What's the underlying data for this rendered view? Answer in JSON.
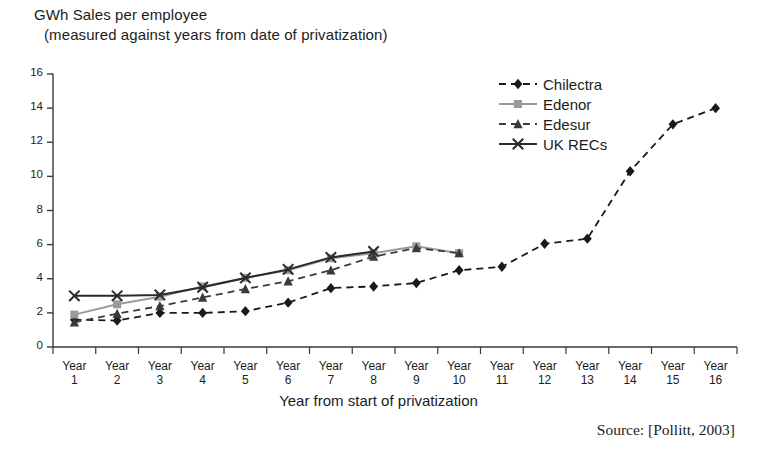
{
  "figure": {
    "title_line1": "GWh Sales per employee",
    "title_line2": "(measured against years from date of privatization)",
    "source": "Source: [Pollitt, 2003]"
  },
  "chart_data": {
    "type": "line",
    "title": "GWh Sales per employee (measured against years from date of privatization)",
    "xlabel": "Year from start of privatization",
    "ylabel": "GWh Sales per employee",
    "xlim": [
      0,
      17
    ],
    "ylim": [
      0,
      16
    ],
    "yticks": [
      0,
      2,
      4,
      6,
      8,
      10,
      12,
      14,
      16
    ],
    "grid": false,
    "legend_position": "top-right",
    "categories": [
      "Year 1",
      "Year 2",
      "Year 3",
      "Year 4",
      "Year 5",
      "Year 6",
      "Year 7",
      "Year 8",
      "Year 9",
      "Year 10",
      "Year 11",
      "Year 12",
      "Year 13",
      "Year 14",
      "Year 15",
      "Year 16"
    ],
    "x": [
      1,
      2,
      3,
      4,
      5,
      6,
      7,
      8,
      9,
      10,
      11,
      12,
      13,
      14,
      15,
      16
    ],
    "series": [
      {
        "name": "Chilectra",
        "color": "#1a1a1a",
        "marker": "diamond",
        "linestyle": "dashed",
        "values": [
          1.6,
          1.55,
          2.0,
          2.0,
          2.1,
          2.6,
          3.45,
          3.55,
          3.75,
          4.5,
          4.7,
          6.05,
          6.35,
          10.3,
          13.05,
          14.0
        ]
      },
      {
        "name": "Edenor",
        "color": "#9a9a9a",
        "marker": "square",
        "linestyle": "solid",
        "values": [
          1.9,
          2.5,
          2.95,
          3.55,
          4.05,
          4.5,
          5.2,
          5.5,
          5.9,
          5.5,
          null,
          null,
          null,
          null,
          null,
          null
        ]
      },
      {
        "name": "Edesur",
        "color": "#3a3a3a",
        "marker": "triangle",
        "linestyle": "dashed",
        "values": [
          1.45,
          1.95,
          2.4,
          2.9,
          3.4,
          3.85,
          4.5,
          5.3,
          5.8,
          5.5,
          null,
          null,
          null,
          null,
          null,
          null
        ]
      },
      {
        "name": "UK RECs",
        "color": "#2a2a2a",
        "marker": "x",
        "linestyle": "solid",
        "values": [
          3.0,
          3.0,
          3.05,
          3.5,
          4.05,
          4.55,
          5.25,
          5.6,
          null,
          null,
          null,
          null,
          null,
          null,
          null,
          null
        ]
      }
    ]
  }
}
